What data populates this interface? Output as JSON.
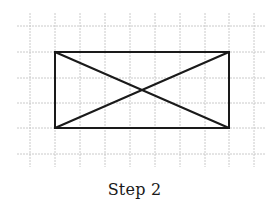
{
  "caption": "Step 2",
  "colors": {
    "grid": "#c4c4c4",
    "shape": "#1a1a1a",
    "background": "#ffffff"
  },
  "grid": {
    "vertical_x": [
      30,
      55,
      80,
      105,
      130,
      155,
      180,
      205,
      229,
      254
    ],
    "horizontal_y": [
      26,
      52,
      78,
      103,
      128,
      154
    ],
    "vertical_extent": [
      13,
      167
    ],
    "horizontal_extent": [
      17,
      265
    ]
  },
  "rectangle": {
    "x1": 55,
    "y1": 52,
    "x2": 229,
    "y2": 128,
    "width_units": 7,
    "height_units": 3
  },
  "diagonals": [
    {
      "from": [
        55,
        52
      ],
      "to": [
        229,
        128
      ]
    },
    {
      "from": [
        55,
        128
      ],
      "to": [
        229,
        52
      ]
    }
  ]
}
